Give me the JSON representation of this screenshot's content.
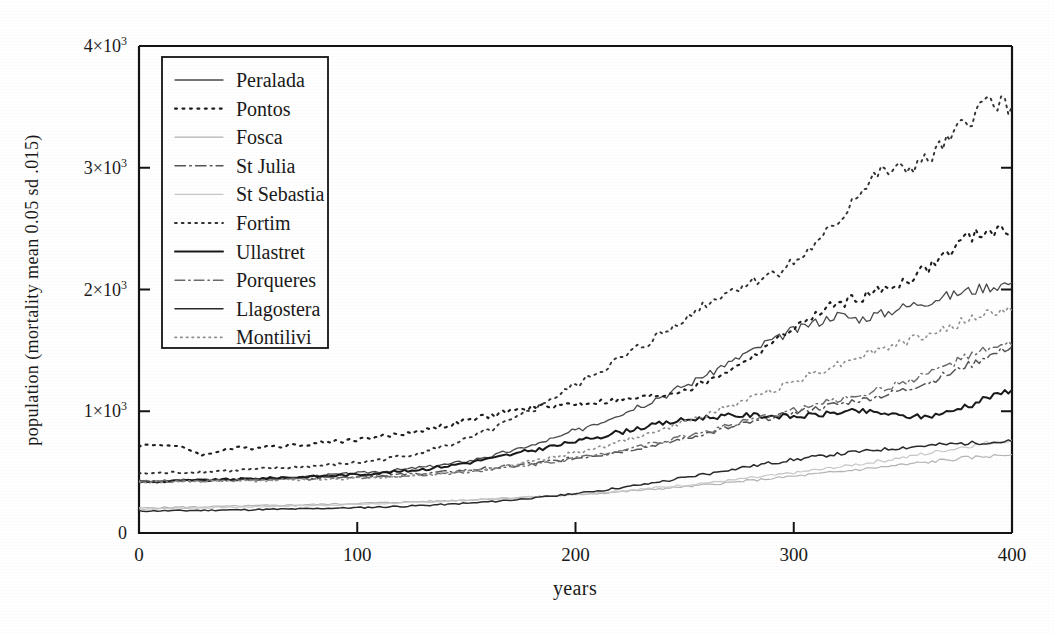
{
  "chart_data": {
    "type": "line",
    "title": "",
    "xlabel": "years",
    "ylabel": "population (mortality mean 0.05 sd .015)",
    "xlim": [
      0,
      400
    ],
    "ylim": [
      0,
      4000
    ],
    "grid": false,
    "legend_position": "upper-left-inside",
    "xticks": [
      "0",
      "100",
      "200",
      "300",
      "400"
    ],
    "xtick_values": [
      0,
      100,
      200,
      300,
      400
    ],
    "yticks": [
      "0",
      "1×10³",
      "2×10³",
      "3×10³",
      "4×10³"
    ],
    "ytick_values": [
      0,
      1000,
      2000,
      3000,
      4000
    ],
    "x": [
      0,
      10,
      20,
      30,
      40,
      50,
      60,
      70,
      80,
      90,
      100,
      110,
      120,
      130,
      140,
      150,
      160,
      170,
      180,
      190,
      200,
      210,
      220,
      230,
      240,
      250,
      260,
      270,
      280,
      290,
      300,
      310,
      320,
      330,
      340,
      350,
      360,
      370,
      380,
      390,
      400
    ],
    "series": [
      {
        "name": "Peralada",
        "style": "solid",
        "color": "#4a4a4a",
        "width": 1.3,
        "values": [
          415,
          420,
          432,
          428,
          440,
          447,
          455,
          452,
          468,
          480,
          492,
          505,
          520,
          540,
          562,
          590,
          628,
          672,
          720,
          775,
          840,
          905,
          975,
          1050,
          1125,
          1210,
          1300,
          1395,
          1490,
          1580,
          1665,
          1730,
          1790,
          1760,
          1800,
          1855,
          1900,
          1945,
          1990,
          2025,
          2055
        ]
      },
      {
        "name": "Pontos",
        "style": "dotted",
        "color": "#1e1e1e",
        "width": 2.1,
        "values": [
          720,
          728,
          700,
          640,
          690,
          700,
          712,
          720,
          735,
          752,
          768,
          790,
          812,
          845,
          880,
          920,
          960,
          1000,
          1030,
          1050,
          1060,
          1075,
          1090,
          1110,
          1135,
          1175,
          1240,
          1330,
          1440,
          1560,
          1680,
          1790,
          1880,
          1935,
          1990,
          2060,
          2160,
          2290,
          2430,
          2480,
          2470
        ]
      },
      {
        "name": "Fosca",
        "style": "solid",
        "color": "#b4b4b4",
        "width": 1.2,
        "values": [
          205,
          208,
          212,
          215,
          219,
          222,
          226,
          230,
          234,
          238,
          243,
          248,
          254,
          259,
          265,
          272,
          280,
          288,
          296,
          305,
          315,
          326,
          338,
          351,
          365,
          380,
          396,
          413,
          430,
          448,
          466,
          484,
          503,
          522,
          541,
          560,
          580,
          600,
          618,
          632,
          645
        ]
      },
      {
        "name": "St Julia",
        "style": "dashdot",
        "color": "#555555",
        "width": 1.5,
        "values": [
          430,
          428,
          432,
          435,
          438,
          442,
          446,
          450,
          455,
          460,
          466,
          472,
          480,
          490,
          502,
          516,
          532,
          550,
          570,
          592,
          615,
          640,
          668,
          700,
          735,
          775,
          818,
          862,
          906,
          948,
          988,
          1024,
          1058,
          1092,
          1128,
          1172,
          1230,
          1300,
          1380,
          1460,
          1530
        ]
      },
      {
        "name": "St Sebastia",
        "style": "solid",
        "color": "#c8c8c8",
        "width": 1.2,
        "values": [
          198,
          200,
          204,
          207,
          211,
          214,
          218,
          222,
          226,
          231,
          236,
          241,
          247,
          253,
          260,
          268,
          277,
          286,
          296,
          307,
          319,
          332,
          346,
          361,
          377,
          394,
          412,
          431,
          451,
          472,
          494,
          517,
          541,
          566,
          592,
          620,
          650,
          682,
          714,
          742,
          762
        ]
      },
      {
        "name": "Fortim",
        "style": "dotted",
        "color": "#333333",
        "width": 1.9,
        "values": [
          488,
          492,
          498,
          505,
          512,
          520,
          529,
          538,
          549,
          562,
          578,
          600,
          628,
          665,
          712,
          770,
          840,
          920,
          1010,
          1110,
          1215,
          1320,
          1425,
          1530,
          1640,
          1760,
          1885,
          1985,
          2060,
          2130,
          2220,
          2360,
          2560,
          2800,
          2960,
          2985,
          3050,
          3200,
          3400,
          3560,
          3500
        ]
      },
      {
        "name": "Ullastret",
        "style": "solid",
        "color": "#1a1a1a",
        "width": 2.0,
        "values": [
          418,
          422,
          428,
          433,
          438,
          444,
          450,
          457,
          464,
          472,
          481,
          492,
          506,
          524,
          548,
          576,
          608,
          642,
          678,
          714,
          752,
          790,
          828,
          866,
          900,
          928,
          950,
          962,
          968,
          962,
          955,
          968,
          990,
          1000,
          985,
          960,
          955,
          990,
          1050,
          1120,
          1175
        ]
      },
      {
        "name": "Porqueres",
        "style": "dashdot",
        "color": "#6a6a6a",
        "width": 1.4,
        "values": [
          425,
          424,
          427,
          429,
          432,
          435,
          438,
          442,
          446,
          450,
          455,
          461,
          468,
          477,
          488,
          502,
          519,
          539,
          562,
          588,
          616,
          647,
          680,
          716,
          754,
          794,
          836,
          880,
          924,
          968,
          1010,
          1052,
          1094,
          1136,
          1180,
          1235,
          1300,
          1375,
          1450,
          1510,
          1545
        ]
      },
      {
        "name": "Llagostera",
        "style": "solid",
        "color": "#2b2b2b",
        "width": 1.5,
        "values": [
          180,
          182,
          184,
          186,
          189,
          191,
          194,
          197,
          200,
          204,
          208,
          213,
          219,
          226,
          234,
          244,
          256,
          270,
          286,
          304,
          324,
          346,
          370,
          396,
          424,
          454,
          486,
          518,
          548,
          576,
          602,
          626,
          648,
          668,
          686,
          702,
          716,
          728,
          738,
          746,
          752
        ]
      },
      {
        "name": "Montilivi",
        "style": "dotted",
        "color": "#8e8e8e",
        "width": 1.6,
        "values": [
          420,
          419,
          421,
          423,
          426,
          429,
          432,
          436,
          440,
          445,
          451,
          458,
          467,
          478,
          492,
          510,
          532,
          558,
          588,
          622,
          660,
          702,
          748,
          798,
          852,
          910,
          972,
          1038,
          1106,
          1176,
          1246,
          1316,
          1386,
          1452,
          1512,
          1566,
          1620,
          1680,
          1750,
          1810,
          1830
        ]
      }
    ]
  },
  "legend": {
    "items": [
      {
        "label": "Peralada"
      },
      {
        "label": "Pontos"
      },
      {
        "label": "Fosca"
      },
      {
        "label": "St Julia"
      },
      {
        "label": "St Sebastia"
      },
      {
        "label": "Fortim"
      },
      {
        "label": "Ullastret"
      },
      {
        "label": "Porqueres"
      },
      {
        "label": "Llagostera"
      },
      {
        "label": "Montilivi"
      }
    ]
  }
}
